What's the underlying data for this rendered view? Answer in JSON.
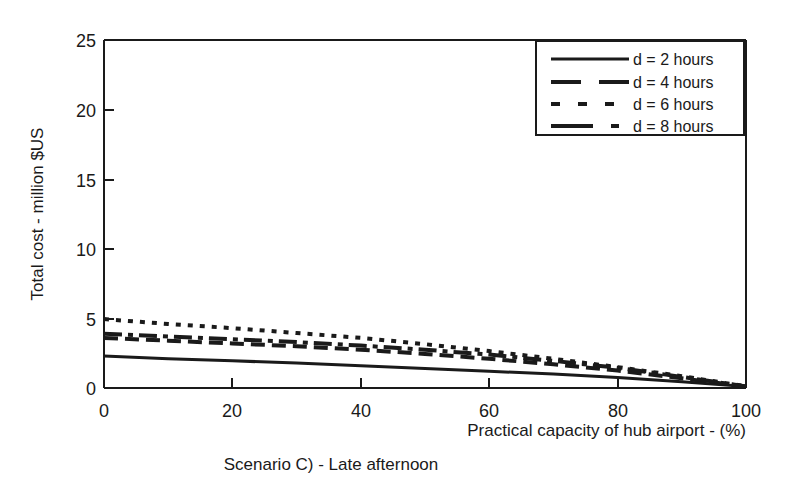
{
  "chart_data": {
    "type": "line",
    "title": "",
    "caption": "Scenario C) - Late afternoon",
    "xlabel": "Practical capacity  of hub airport - (%)",
    "ylabel": "Total cost - million $US",
    "xlim": [
      0,
      100
    ],
    "ylim": [
      0,
      25
    ],
    "xticks": [
      0,
      20,
      40,
      60,
      80,
      100
    ],
    "yticks": [
      0,
      5,
      10,
      15,
      20,
      25
    ],
    "xtick_labels": [
      "0",
      "20",
      "40",
      "60",
      "80",
      "100"
    ],
    "ytick_labels": [
      "0",
      "5",
      "10",
      "15",
      "20",
      "25"
    ],
    "grid": false,
    "legend_position": "top-right",
    "x": [
      0,
      10,
      20,
      30,
      40,
      50,
      60,
      70,
      80,
      90,
      100
    ],
    "series": [
      {
        "name": "d = 2 hours",
        "label": "d = 2 hours",
        "style": "solid",
        "dasharray": "",
        "width": 3,
        "values": [
          2.3,
          2.1,
          1.95,
          1.8,
          1.6,
          1.4,
          1.2,
          1.0,
          0.75,
          0.45,
          0.1
        ]
      },
      {
        "name": "d = 4 hours",
        "label": "d = 4 hours",
        "style": "long-dash",
        "dasharray": "14,7",
        "width": 4,
        "values": [
          3.6,
          3.4,
          3.2,
          3.0,
          2.75,
          2.45,
          2.1,
          1.7,
          1.25,
          0.7,
          0.1
        ]
      },
      {
        "name": "d = 6 hours",
        "label": "d = 6 hours",
        "style": "short-dash",
        "dasharray": "5,7",
        "width": 4,
        "values": [
          4.95,
          4.6,
          4.3,
          3.95,
          3.6,
          3.15,
          2.65,
          2.1,
          1.5,
          0.85,
          0.12
        ]
      },
      {
        "name": "d = 8 hours",
        "label": "d = 8 hours",
        "style": "dash-dot",
        "dasharray": "18,6,5,6",
        "width": 4,
        "values": [
          3.9,
          3.7,
          3.5,
          3.3,
          3.05,
          2.75,
          2.4,
          1.95,
          1.45,
          0.8,
          0.11
        ]
      }
    ]
  },
  "colors": {
    "ink": "#1a1a1a",
    "background": "#ffffff"
  }
}
